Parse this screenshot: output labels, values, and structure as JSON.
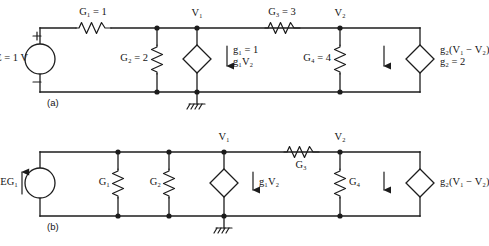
{
  "figure": {
    "panels": [
      {
        "tag": "(a)",
        "name": "thevenin-form-circuit",
        "source": {
          "type": "voltage-source",
          "label": "E = 1 V",
          "label_parts": {
            "symbol": "E",
            "equals": "=",
            "value": "1 V"
          },
          "plus": "+",
          "minus": "−"
        },
        "elements": [
          {
            "name": "resistor-g1",
            "label": "G₁ = 1",
            "sym": "G",
            "sub": "1",
            "value": "1",
            "orientation": "horizontal"
          },
          {
            "name": "resistor-g2",
            "label": "G₂ = 2",
            "sym": "G",
            "sub": "2",
            "value": "2",
            "orientation": "vertical"
          },
          {
            "name": "resistor-g3",
            "label": "G₃ = 3",
            "sym": "G",
            "sub": "3",
            "value": "3",
            "orientation": "horizontal"
          },
          {
            "name": "resistor-g4",
            "label": "G₄ = 4",
            "sym": "G",
            "sub": "4",
            "value": "4",
            "orientation": "vertical"
          }
        ],
        "dependent_sources": [
          {
            "name": "vccs-g1v2",
            "line1": "g₁ = 1",
            "line2": "g₁V₂",
            "arrow": "down"
          },
          {
            "name": "vccs-g2v1v2",
            "line1": "g₂(V₁ − V₂)",
            "line2": "g₂ = 2",
            "arrow": "down"
          }
        ],
        "nodes": [
          {
            "name": "node-v1",
            "label": "V₁"
          },
          {
            "name": "node-v2",
            "label": "V₂"
          }
        ],
        "ground": {
          "name": "ground-symbol",
          "label": ""
        }
      },
      {
        "tag": "(b)",
        "name": "norton-form-circuit",
        "source": {
          "type": "current-source",
          "label": "J = EG₁",
          "arrow": "up"
        },
        "elements": [
          {
            "name": "resistor-g1",
            "label": "G₁",
            "sym": "G",
            "sub": "1",
            "orientation": "vertical"
          },
          {
            "name": "resistor-g2",
            "label": "G₂",
            "sym": "G",
            "sub": "2",
            "orientation": "vertical"
          },
          {
            "name": "resistor-g3",
            "label": "G₃",
            "sym": "G",
            "sub": "3",
            "orientation": "horizontal"
          },
          {
            "name": "resistor-g4",
            "label": "G₄",
            "sym": "G",
            "sub": "4",
            "orientation": "vertical"
          }
        ],
        "dependent_sources": [
          {
            "name": "vccs-g1v2",
            "line1": "g₁V₂",
            "line2": "",
            "arrow": "down"
          },
          {
            "name": "vccs-g2v1v2",
            "line1": "g₂(V₁ − V₂)",
            "line2": "",
            "arrow": "down"
          }
        ],
        "nodes": [
          {
            "name": "node-v1",
            "label": "V₁"
          },
          {
            "name": "node-v2",
            "label": "V₂"
          }
        ],
        "ground": {
          "name": "ground-symbol",
          "label": ""
        }
      }
    ],
    "colors": {
      "ink": "#1c1c1c",
      "background": "#ffffff"
    }
  }
}
